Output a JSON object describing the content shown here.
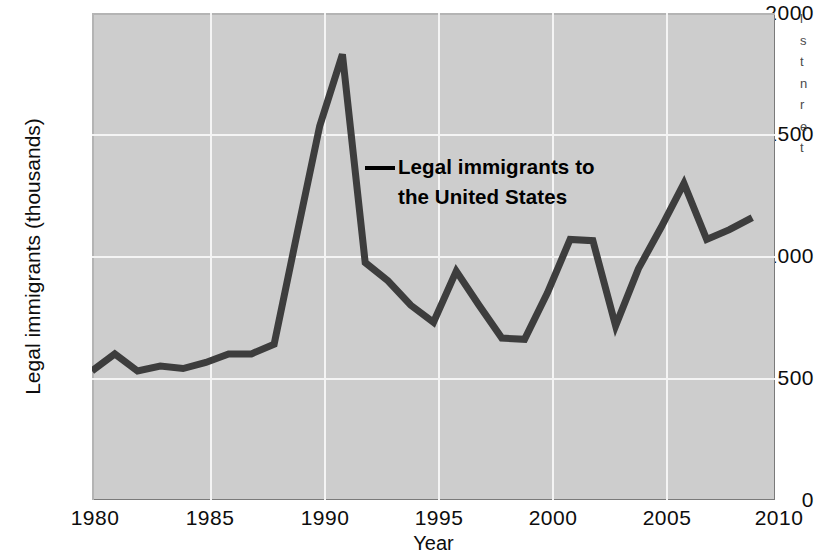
{
  "chart_data": {
    "type": "line",
    "title": "",
    "xlabel": "Year",
    "ylabel": "Legal immigrants (thousands)",
    "xlim": [
      1980,
      2010
    ],
    "ylim": [
      0,
      2000
    ],
    "xticks": [
      "1980",
      "1985",
      "1990",
      "1995",
      "2000",
      "2005",
      "2010"
    ],
    "xtick_values": [
      1980,
      1985,
      1990,
      1995,
      2000,
      2005,
      2010
    ],
    "yticks": [
      "0",
      "500",
      "1000",
      "1500",
      "2000"
    ],
    "ytick_values": [
      0,
      500,
      1000,
      1500,
      2000
    ],
    "grid": true,
    "legend": "none",
    "series_name": "Legal immigrants to the United States",
    "x": [
      1980,
      1981,
      1982,
      1983,
      1984,
      1985,
      1986,
      1987,
      1988,
      1989,
      1990,
      1991,
      1992,
      1993,
      1994,
      1995,
      1996,
      1997,
      1998,
      1999,
      2000,
      2001,
      2002,
      2003,
      2004,
      2005,
      2006,
      2007,
      2008,
      2009
    ],
    "values": [
      530,
      600,
      530,
      550,
      540,
      565,
      600,
      600,
      640,
      1090,
      1535,
      1830,
      975,
      900,
      800,
      730,
      940,
      800,
      665,
      660,
      850,
      1070,
      1065,
      715,
      950,
      1120,
      1300,
      1070,
      1110,
      1160
    ],
    "annotation": {
      "text_line1": "Legal immigrants to",
      "text_line2": "the United States",
      "points_to_year": 1992
    },
    "colors": {
      "line": "#3d3d3d",
      "plot_background": "#cdcdcd",
      "gridline": "#f4f4f4",
      "text": "#0d0d0d"
    }
  },
  "margin_notes": {
    "lines": [
      "l",
      "s",
      "t",
      "n",
      "r",
      "e",
      "t"
    ]
  }
}
